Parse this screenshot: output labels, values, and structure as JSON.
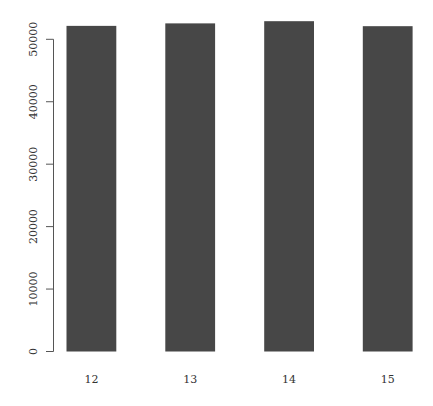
{
  "chart_data": {
    "type": "bar",
    "title": "",
    "xlabel": "",
    "ylabel": "",
    "categories": [
      "12",
      "13",
      "14",
      "15"
    ],
    "values": [
      52150,
      52550,
      52900,
      52100
    ],
    "ylim": [
      0,
      53000
    ],
    "yticks": [
      0,
      10000,
      20000,
      30000,
      40000,
      50000
    ],
    "ytick_labels": [
      "0",
      "10000",
      "20000",
      "30000",
      "40000",
      "50000"
    ],
    "grid": false,
    "legend": null,
    "bar_color": "#474747",
    "axis_color": "#555555"
  }
}
